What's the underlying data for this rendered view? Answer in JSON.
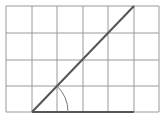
{
  "diagram": {
    "type": "grid-angle",
    "grid": {
      "columns": 6,
      "rows": 4,
      "x_lines": [
        6,
        32,
        57,
        83,
        108,
        134,
        159
      ],
      "y_lines": [
        6,
        33,
        60,
        86,
        112
      ],
      "color": "#9a9a9a"
    },
    "ray": {
      "x1": 32,
      "y1": 112,
      "x2": 134,
      "y2": 6,
      "color": "#555555"
    },
    "base": {
      "x1": 32,
      "y1": 112,
      "x2": 134,
      "y2": 112,
      "color": "#555555"
    },
    "angle_arc": {
      "cx": 32,
      "cy": 112,
      "r": 36,
      "color": "#777777"
    }
  }
}
